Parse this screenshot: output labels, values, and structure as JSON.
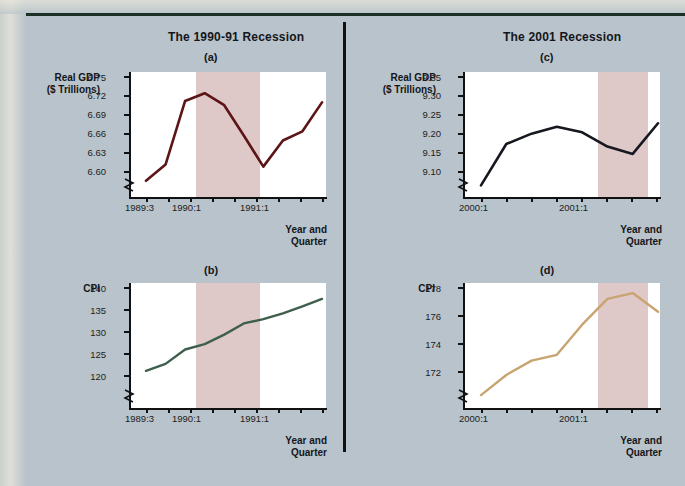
{
  "figure": {
    "background_color": "#b9c3cb",
    "divider_color": "#111111",
    "left_title": "The 1990-91 Recession",
    "right_title": "The 2001 Recession",
    "recession_band_color": "#dec8c8",
    "xaxis_title_line1": "Year and",
    "xaxis_title_line2": "Quarter"
  },
  "panels": {
    "a": {
      "letter": "(a)",
      "ylabel_line1": "Real GDP",
      "ylabel_line2": "($ Trillions)",
      "yticks": [
        "6.75",
        "6.72",
        "6.69",
        "6.66",
        "6.63",
        "6.60"
      ],
      "xticks": [
        "1989:3",
        "1990:1",
        "1991:1"
      ],
      "line_color": "#5c1414"
    },
    "b": {
      "letter": "(b)",
      "ylabel_line1": "CPI",
      "ylabel_line2": "",
      "yticks": [
        "140",
        "135",
        "130",
        "125",
        "120"
      ],
      "xticks": [
        "1989:3",
        "1990:1",
        "1991:1"
      ],
      "line_color": "#3f5f4d"
    },
    "c": {
      "letter": "(c)",
      "ylabel_line1": "Real GDP",
      "ylabel_line2": "($ Trillions)",
      "yticks": [
        "9.35",
        "9.30",
        "9.25",
        "9.20",
        "9.15",
        "9.10"
      ],
      "xticks": [
        "2000:1",
        "2001:1"
      ],
      "line_color": "#15181f"
    },
    "d": {
      "letter": "(d)",
      "ylabel_line1": "CPI",
      "ylabel_line2": "",
      "yticks": [
        "178",
        "176",
        "174",
        "172"
      ],
      "xticks": [
        "2000:1",
        "2001:1"
      ],
      "line_color": "#c8a471"
    }
  },
  "chart_data": [
    {
      "id": "a",
      "type": "line",
      "title": "The 1990-91 Recession",
      "subtitle": "(a)",
      "ylabel": "Real GDP ($ Trillions)",
      "xlabel": "Year and Quarter",
      "ylim": [
        6.585,
        6.762
      ],
      "yticks": [
        6.6,
        6.63,
        6.66,
        6.69,
        6.72,
        6.75
      ],
      "axis_break": true,
      "grid": false,
      "legend": "none",
      "x": [
        "1989:3",
        "1989:4",
        "1990:1",
        "1990:2",
        "1990:3",
        "1990:4",
        "1991:1",
        "1991:2",
        "1991:3",
        "1991:4"
      ],
      "xtick_labels_shown": [
        "1989:3",
        "1990:1",
        "1991:1"
      ],
      "values": [
        6.608,
        6.631,
        6.721,
        6.732,
        6.715,
        6.672,
        6.628,
        6.665,
        6.678,
        6.719
      ],
      "line_color": "#5c1414",
      "shaded_region": {
        "from": "1990:2",
        "to": "1991:1",
        "color": "#dec8c8",
        "label": "recession"
      }
    },
    {
      "id": "b",
      "type": "line",
      "title": "The 1990-91 Recession",
      "subtitle": "(b)",
      "ylabel": "CPI",
      "xlabel": "Year and Quarter",
      "ylim": [
        118.0,
        141.5
      ],
      "yticks": [
        120,
        125,
        130,
        135,
        140
      ],
      "axis_break": true,
      "grid": false,
      "legend": "none",
      "x": [
        "1989:3",
        "1989:4",
        "1990:1",
        "1990:2",
        "1990:3",
        "1990:4",
        "1991:1",
        "1991:2",
        "1991:3",
        "1991:4"
      ],
      "xtick_labels_shown": [
        "1989:3",
        "1990:1",
        "1991:1"
      ],
      "values": [
        125.0,
        126.3,
        129.0,
        130.0,
        131.8,
        133.9,
        134.7,
        135.8,
        137.1,
        138.5
      ],
      "line_color": "#3f5f4d",
      "shaded_region": {
        "from": "1990:2",
        "to": "1991:1",
        "color": "#dec8c8",
        "label": "recession"
      }
    },
    {
      "id": "c",
      "type": "line",
      "title": "The 2001 Recession",
      "subtitle": "(c)",
      "ylabel": "Real GDP ($ Trillions)",
      "xlabel": "Year and Quarter",
      "ylim": [
        9.075,
        9.365
      ],
      "yticks": [
        9.1,
        9.15,
        9.2,
        9.25,
        9.3,
        9.35
      ],
      "axis_break": true,
      "grid": false,
      "legend": "none",
      "x": [
        "2000:1",
        "2000:2",
        "2000:3",
        "2000:4",
        "2001:1",
        "2001:2",
        "2001:3",
        "2001:4"
      ],
      "xtick_labels_shown": [
        "2000:1",
        "2001:1"
      ],
      "values": [
        9.102,
        9.198,
        9.222,
        9.238,
        9.225,
        9.192,
        9.175,
        9.246
      ],
      "line_color": "#15181f",
      "shaded_region": {
        "from": "2001:2",
        "to": "2001:4",
        "color": "#dec8c8",
        "label": "recession"
      }
    },
    {
      "id": "d",
      "type": "line",
      "title": "The 2001 Recession",
      "subtitle": "(d)",
      "ylabel": "CPI",
      "xlabel": "Year and Quarter",
      "ylim": [
        170.3,
        179.0
      ],
      "yticks": [
        172,
        174,
        176,
        178
      ],
      "axis_break": true,
      "grid": false,
      "legend": "none",
      "x": [
        "2000:1",
        "2000:2",
        "2000:3",
        "2000:4",
        "2001:1",
        "2001:2",
        "2001:3",
        "2001:4"
      ],
      "xtick_labels_shown": [
        "2000:1",
        "2001:1"
      ],
      "values": [
        171.2,
        172.6,
        173.6,
        174.0,
        176.1,
        177.9,
        178.3,
        177.0
      ],
      "line_color": "#c8a471",
      "shaded_region": {
        "from": "2001:2",
        "to": "2001:4",
        "color": "#dec8c8",
        "label": "recession"
      }
    }
  ]
}
